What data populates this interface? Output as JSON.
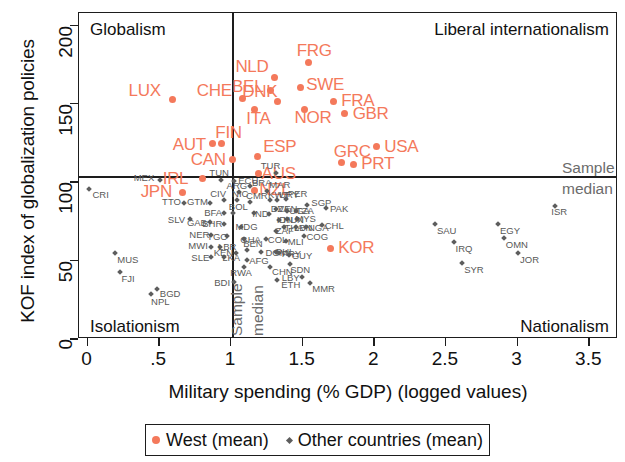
{
  "chart_data": {
    "type": "scatter",
    "title": "",
    "xlabel": "Military spending (% GDP) (logged values)",
    "ylabel": "KOF index of globalization policies",
    "xlim": [
      -0.06,
      3.7
    ],
    "ylim": [
      0,
      208
    ],
    "xticks": [
      "0",
      ".5",
      "1",
      "1.5",
      "2",
      "2.5",
      "3",
      "3.5"
    ],
    "xtickvals": [
      0,
      0.5,
      1,
      1.5,
      2,
      2.5,
      3,
      3.5
    ],
    "yticks": [
      "0",
      "50",
      "100",
      "150",
      "200"
    ],
    "ytickvals": [
      0,
      50,
      100,
      150,
      200
    ],
    "grid": false,
    "reference_lines": {
      "vertical_label": "Sample",
      "vertical_label_2": "median",
      "horizontal_label": "Sample",
      "horizontal_label_2": "median",
      "x_median": 1.13,
      "y_median": 100
    },
    "quadrant_labels": {
      "top_left": "Globalism",
      "top_right": "Liberal internationalism",
      "bottom_left": "Isolationism",
      "bottom_right": "Nationalism"
    },
    "legend": {
      "position": "below",
      "entries": [
        {
          "name": "West (mean)",
          "color": "#f4795b",
          "marker": "circle"
        },
        {
          "name": "Other countries (mean)",
          "color": "#5d5d5d",
          "marker": "diamond"
        }
      ]
    },
    "series": [
      {
        "name": "West (mean)",
        "color": "#f4795b",
        "points": [
          {
            "label": "LUX",
            "x": 0.6,
            "y": 152,
            "lx": -44,
            "ly": -14
          },
          {
            "label": "CHE",
            "x": 1.09,
            "y": 153,
            "lx": -46,
            "ly": -12
          },
          {
            "label": "NLD",
            "x": 1.31,
            "y": 166,
            "lx": -39,
            "ly": -16
          },
          {
            "label": "BEL",
            "x": 1.28,
            "y": 158,
            "lx": -38,
            "ly": -8
          },
          {
            "label": "DNK",
            "x": 1.33,
            "y": 151,
            "lx": -35,
            "ly": -14
          },
          {
            "label": "ITA",
            "x": 1.17,
            "y": 146,
            "lx": -8,
            "ly": 5
          },
          {
            "label": "FRG",
            "x": 1.55,
            "y": 176,
            "lx": -12,
            "ly": -16
          },
          {
            "label": "SWE",
            "x": 1.49,
            "y": 160,
            "lx": 6,
            "ly": -7
          },
          {
            "label": "NOR",
            "x": 1.52,
            "y": 146,
            "lx": -10,
            "ly": 4
          },
          {
            "label": "FRA",
            "x": 1.72,
            "y": 151,
            "lx": 8,
            "ly": -5
          },
          {
            "label": "GBR",
            "x": 1.8,
            "y": 143,
            "lx": 8,
            "ly": -5
          },
          {
            "label": "USA",
            "x": 2.02,
            "y": 122,
            "lx": 8,
            "ly": -5
          },
          {
            "label": "AUT",
            "x": 0.88,
            "y": 124,
            "lx": -40,
            "ly": -4
          },
          {
            "label": "FIN",
            "x": 0.94,
            "y": 124,
            "lx": -6,
            "ly": -16
          },
          {
            "label": "CAN",
            "x": 1.02,
            "y": 114,
            "lx": -42,
            "ly": -4
          },
          {
            "label": "ESP",
            "x": 1.19,
            "y": 116,
            "lx": 6,
            "ly": -14
          },
          {
            "label": "AUS",
            "x": 1.2,
            "y": 105,
            "lx": 3,
            "ly": -4
          },
          {
            "label": "GRC",
            "x": 1.78,
            "y": 112,
            "lx": -8,
            "ly": -15
          },
          {
            "label": "PRT",
            "x": 1.86,
            "y": 111,
            "lx": 8,
            "ly": -5
          },
          {
            "label": "IRL",
            "x": 0.81,
            "y": 102,
            "lx": -40,
            "ly": -4
          },
          {
            "label": "JPN",
            "x": 0.67,
            "y": 93,
            "lx": -42,
            "ly": -5
          },
          {
            "label": "NZL",
            "x": 1.17,
            "y": 94,
            "lx": 5,
            "ly": -6
          },
          {
            "label": "KOR",
            "x": 1.7,
            "y": 57,
            "lx": 8,
            "ly": -6
          }
        ]
      },
      {
        "name": "Other countries (mean)",
        "color": "#5d5d5d",
        "points": [
          {
            "label": "CRI",
            "x": 0.02,
            "y": 95,
            "lx": 3,
            "ly": 3
          },
          {
            "label": "MEX",
            "x": 0.51,
            "y": 101,
            "lx": -26,
            "ly": -5
          },
          {
            "label": "MUS",
            "x": 0.2,
            "y": 54,
            "lx": 2,
            "ly": 4
          },
          {
            "label": "FJI",
            "x": 0.23,
            "y": 42,
            "lx": 2,
            "ly": 4
          },
          {
            "label": "BGD",
            "x": 0.49,
            "y": 31,
            "lx": 3,
            "ly": 2
          },
          {
            "label": "NPL",
            "x": 0.45,
            "y": 28,
            "lx": 0,
            "ly": 5
          },
          {
            "label": "TTO",
            "x": 0.68,
            "y": 86,
            "lx": -22,
            "ly": -4
          },
          {
            "label": "SLV",
            "x": 0.72,
            "y": 76,
            "lx": -22,
            "ly": -2
          },
          {
            "label": "GTM",
            "x": 0.86,
            "y": 86,
            "lx": -23,
            "ly": -4
          },
          {
            "label": "GAB",
            "x": 0.86,
            "y": 74,
            "lx": -23,
            "ly": -2
          },
          {
            "label": "BFA",
            "x": 0.96,
            "y": 80,
            "lx": -20,
            "ly": -3
          },
          {
            "label": "BOL",
            "x": 1.02,
            "y": 80,
            "lx": -4,
            "ly": -9
          },
          {
            "label": "BHR",
            "x": 0.96,
            "y": 73,
            "lx": -22,
            "ly": -3
          },
          {
            "label": "NER",
            "x": 0.87,
            "y": 66,
            "lx": -22,
            "ly": -3
          },
          {
            "label": "TGO",
            "x": 0.98,
            "y": 65,
            "lx": -20,
            "ly": -2
          },
          {
            "label": "MWI",
            "x": 0.87,
            "y": 58,
            "lx": -23,
            "ly": -4
          },
          {
            "label": "LBR",
            "x": 0.93,
            "y": 58,
            "lx": -2,
            "ly": -3
          },
          {
            "label": "SLE",
            "x": 0.87,
            "y": 52,
            "lx": -20,
            "ly": -2
          },
          {
            "label": "LKA",
            "x": 0.96,
            "y": 52,
            "lx": -2,
            "ly": -2
          },
          {
            "label": "KEN",
            "x": 1.04,
            "y": 54,
            "lx": -22,
            "ly": -3
          },
          {
            "label": "CIV",
            "x": 0.96,
            "y": 88,
            "lx": -14,
            "ly": -9
          },
          {
            "label": "NIC",
            "x": 1.05,
            "y": 88,
            "lx": -5,
            "ly": -9
          },
          {
            "label": "ARG",
            "x": 1.06,
            "y": 93,
            "lx": -12,
            "ly": -9
          },
          {
            "label": "TUN",
            "x": 0.94,
            "y": 101,
            "lx": -12,
            "ly": -10
          },
          {
            "label": "ECU",
            "x": 1.03,
            "y": 100,
            "lx": 4,
            "ly": -3
          },
          {
            "label": "MDG",
            "x": 1.08,
            "y": 71,
            "lx": -6,
            "ly": -3
          },
          {
            "label": "GHA",
            "x": 1.1,
            "y": 63,
            "lx": -4,
            "ly": -2
          },
          {
            "label": "BEN",
            "x": 1.12,
            "y": 56,
            "lx": -4,
            "ly": -9
          },
          {
            "label": "AFG",
            "x": 1.12,
            "y": 50,
            "lx": 2,
            "ly": -2
          },
          {
            "label": "RWA",
            "x": 1.1,
            "y": 45,
            "lx": -14,
            "ly": 3
          },
          {
            "label": "BDI",
            "x": 1.03,
            "y": 36,
            "lx": -20,
            "ly": -2
          },
          {
            "label": "BRA",
            "x": 1.14,
            "y": 97,
            "lx": 2,
            "ly": -6
          },
          {
            "label": "CMR",
            "x": 1.14,
            "y": 87,
            "lx": -4,
            "ly": -9
          },
          {
            "label": "IND",
            "x": 1.17,
            "y": 80,
            "lx": -2,
            "ly": -2
          },
          {
            "label": "DZA",
            "x": 1.27,
            "y": 79,
            "lx": 2,
            "ly": -8
          },
          {
            "label": "COL",
            "x": 1.25,
            "y": 63,
            "lx": 2,
            "ly": -2
          },
          {
            "label": "DOM",
            "x": 1.22,
            "y": 55,
            "lx": 4,
            "ly": -2
          },
          {
            "label": "CHN",
            "x": 1.28,
            "y": 45,
            "lx": 2,
            "ly": 2
          },
          {
            "label": "ETH",
            "x": 1.33,
            "y": 37,
            "lx": 4,
            "ly": 2
          },
          {
            "label": "MAR",
            "x": 1.26,
            "y": 94,
            "lx": 2,
            "ly": -9
          },
          {
            "label": "KWT",
            "x": 1.28,
            "y": 88,
            "lx": -2,
            "ly": -8
          },
          {
            "label": "URY",
            "x": 1.33,
            "y": 88,
            "lx": 2,
            "ly": -8
          },
          {
            "label": "VEN",
            "x": 1.32,
            "y": 82,
            "lx": 2,
            "ly": -3
          },
          {
            "label": "UGA",
            "x": 1.4,
            "y": 81,
            "lx": 2,
            "ly": -3
          },
          {
            "label": "TZA",
            "x": 1.46,
            "y": 81,
            "lx": 0,
            "ly": -3
          },
          {
            "label": "HUN",
            "x": 1.4,
            "y": 76,
            "lx": -4,
            "ly": -2
          },
          {
            "label": "MYS",
            "x": 1.47,
            "y": 76,
            "lx": -2,
            "ly": -3
          },
          {
            "label": "IDN",
            "x": 1.34,
            "y": 75,
            "lx": -2,
            "ly": -3
          },
          {
            "label": "THA",
            "x": 1.38,
            "y": 71,
            "lx": 0,
            "ly": -2
          },
          {
            "label": "LBN",
            "x": 1.46,
            "y": 71,
            "lx": -2,
            "ly": -2
          },
          {
            "label": "NGA",
            "x": 1.53,
            "y": 71,
            "lx": 2,
            "ly": -2
          },
          {
            "label": "CHL",
            "x": 1.64,
            "y": 72,
            "lx": 3,
            "ly": -2
          },
          {
            "label": "ZAF",
            "x": 1.32,
            "y": 68,
            "lx": 0,
            "ly": -3
          },
          {
            "label": "MLI",
            "x": 1.39,
            "y": 62,
            "lx": 2,
            "ly": -2
          },
          {
            "label": "COG",
            "x": 1.52,
            "y": 65,
            "lx": 2,
            "ly": -2
          },
          {
            "label": "PHL",
            "x": 1.32,
            "y": 55,
            "lx": 0,
            "ly": -3
          },
          {
            "label": "PRY",
            "x": 1.34,
            "y": 54,
            "lx": 3,
            "ly": -2
          },
          {
            "label": "GUY",
            "x": 1.41,
            "y": 53,
            "lx": 3,
            "ly": -2
          },
          {
            "label": "SDN",
            "x": 1.42,
            "y": 47,
            "lx": 0,
            "ly": 3
          },
          {
            "label": "LBY",
            "x": 1.5,
            "y": 39,
            "lx": -20,
            "ly": -2
          },
          {
            "label": "MMR",
            "x": 1.56,
            "y": 35,
            "lx": 2,
            "ly": 3
          },
          {
            "label": "PER",
            "x": 1.39,
            "y": 89,
            "lx": 2,
            "ly": -8
          },
          {
            "label": "SGP",
            "x": 1.54,
            "y": 85,
            "lx": 4,
            "ly": -5
          },
          {
            "label": "PAK",
            "x": 1.67,
            "y": 83,
            "lx": 4,
            "ly": -2
          },
          {
            "label": "TUR",
            "x": 1.32,
            "y": 105,
            "lx": -15,
            "ly": -10
          },
          {
            "label": "SAU",
            "x": 2.43,
            "y": 73,
            "lx": 2,
            "ly": 4
          },
          {
            "label": "IRQ",
            "x": 2.56,
            "y": 61,
            "lx": 2,
            "ly": 4
          },
          {
            "label": "SYR",
            "x": 2.62,
            "y": 48,
            "lx": 2,
            "ly": 4
          },
          {
            "label": "EGY",
            "x": 2.87,
            "y": 73,
            "lx": 2,
            "ly": 4
          },
          {
            "label": "OMN",
            "x": 2.91,
            "y": 64,
            "lx": 2,
            "ly": 4
          },
          {
            "label": "JOR",
            "x": 3.01,
            "y": 54,
            "lx": 2,
            "ly": 4
          },
          {
            "label": "ISR",
            "x": 3.27,
            "y": 84,
            "lx": -4,
            "ly": 3
          }
        ]
      }
    ]
  }
}
